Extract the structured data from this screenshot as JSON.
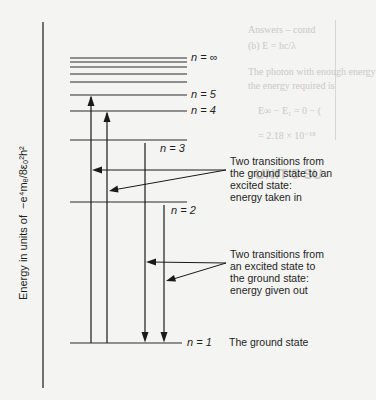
{
  "diagram": {
    "axis_label_prefix": "Energy in units of",
    "axis_label_unit": "−e⁴mₑ/8ε₀²h²",
    "levels": [
      {
        "label": "n = ∞",
        "y": 58
      },
      {
        "label": "",
        "y": 62
      },
      {
        "label": "",
        "y": 67
      },
      {
        "label": "",
        "y": 74
      },
      {
        "label": "",
        "y": 82
      },
      {
        "label": "n = 5",
        "y": 95
      },
      {
        "label": "n = 4",
        "y": 111
      },
      {
        "label": "n = 3",
        "y": 140
      },
      {
        "label": "n = 2",
        "y": 202
      },
      {
        "label": "n = 1",
        "y": 343
      }
    ],
    "transitions": [
      {
        "from": "n = 1",
        "to": "n = 5",
        "direction": "up",
        "x": 91
      },
      {
        "from": "n = 1",
        "to": "n = 4",
        "direction": "up",
        "x": 107
      },
      {
        "from": "n = 3",
        "to": "n = 1",
        "direction": "down",
        "x": 145
      },
      {
        "from": "n = 2",
        "to": "n = 1",
        "direction": "down",
        "x": 164
      }
    ],
    "annotations": {
      "absorption": [
        "Two transitions from",
        "the ground state to an",
        "excited state:",
        "energy taken in"
      ],
      "emission": [
        "Two transitions from",
        "an excited state to",
        "the ground state:",
        "energy given out"
      ],
      "ground_state": "The ground state"
    },
    "labels": {
      "n_inf": "n = ∞",
      "n5": "n = 5",
      "n4": "n = 4",
      "n3": "n = 3",
      "n2": "n = 2",
      "n1": "n = 1"
    }
  },
  "background_bleed": {
    "lines": [
      "Answers – contd",
      "(b) E = hc/λ",
      "The photon with enough energy",
      "the energy required is",
      "E∞ − E₁ = 0 − (",
      "= 2.18 × 10⁻¹⁸",
      "UNIT 5 SU"
    ]
  }
}
